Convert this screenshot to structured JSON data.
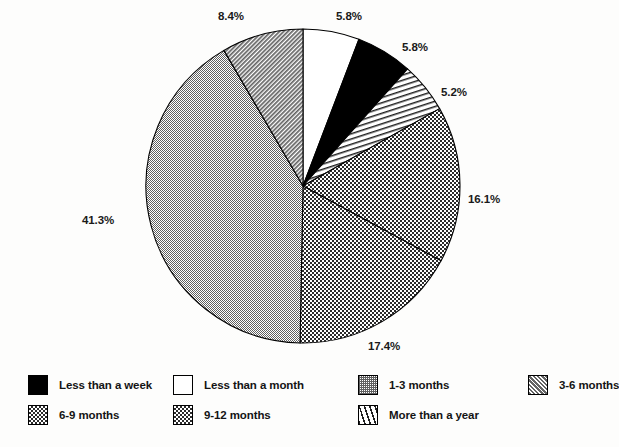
{
  "chart_data": {
    "type": "pie",
    "title": "",
    "subtitle": "",
    "xlabel": "",
    "ylabel": "",
    "legend_position": "bottom",
    "grid": false,
    "start_angle_deg": 0,
    "direction": "clockwise",
    "categories": [
      "Less than a week",
      "Less than a month",
      "1-3 months",
      "3-6 months",
      "6-9 months",
      "9-12 months",
      "More than a year"
    ],
    "values": [
      5.8,
      5.8,
      41.3,
      8.4,
      17.4,
      16.1,
      5.2
    ],
    "value_labels": [
      "5.8%",
      "5.8%",
      "41.3%",
      "8.4%",
      "17.4%",
      "16.1%",
      "5.2%"
    ],
    "units": "percent",
    "slices": [
      {
        "label": "Less than a month",
        "value": 5.8,
        "value_label": "5.8%",
        "pattern": "solid-white",
        "fill": "#ffffff",
        "order_clockwise_from_top": 1,
        "label_x": 336,
        "label_y": 10
      },
      {
        "label": "Less than a week",
        "value": 5.8,
        "value_label": "5.8%",
        "pattern": "solid-black",
        "fill": "#000000",
        "order_clockwise_from_top": 2,
        "label_x": 402,
        "label_y": 41
      },
      {
        "label": "More than a year",
        "value": 5.2,
        "value_label": "5.2%",
        "pattern": "diagonal-lines",
        "fill": "#ffffff",
        "order_clockwise_from_top": 3,
        "label_x": 441,
        "label_y": 86
      },
      {
        "label": "9-12 months",
        "value": 16.1,
        "value_label": "16.1%",
        "pattern": "checkerboard",
        "fill": "#8a8a8a",
        "order_clockwise_from_top": 4,
        "label_x": 468,
        "label_y": 193
      },
      {
        "label": "6-9 months",
        "value": 17.4,
        "value_label": "17.4%",
        "pattern": "checkerboard",
        "fill": "#8a8a8a",
        "order_clockwise_from_top": 5,
        "label_x": 368,
        "label_y": 340
      },
      {
        "label": "1-3 months",
        "value": 41.3,
        "value_label": "41.3%",
        "pattern": "dense-grey-hatch",
        "fill": "#9b9b9b",
        "order_clockwise_from_top": 6,
        "label_x": 82,
        "label_y": 214
      },
      {
        "label": "3-6 months",
        "value": 8.4,
        "value_label": "8.4%",
        "pattern": "grey-diagonal-hatch",
        "fill": "#9b9b9b",
        "order_clockwise_from_top": 7,
        "label_x": 218,
        "label_y": 10
      }
    ]
  },
  "legend": {
    "rows": [
      [
        {
          "label": "Less than a week",
          "pattern": "solid-black"
        },
        {
          "label": "Less than a month",
          "pattern": "solid-white"
        },
        {
          "label": "1-3 months",
          "pattern": "dense-grey-hatch"
        },
        {
          "label": "3-6 months",
          "pattern": "grey-diagonal-hatch"
        }
      ],
      [
        {
          "label": "6-9 months",
          "pattern": "checkerboard"
        },
        {
          "label": "9-12 months",
          "pattern": "checkerboard"
        },
        {
          "label": "More than a year",
          "pattern": "diagonal-lines"
        }
      ]
    ]
  },
  "colors": {
    "outline": "#000000",
    "text": "#141414",
    "background": "#fdfdfc",
    "grey_fill": "#9b9b9b",
    "checker_fill": "#8a8a8a"
  }
}
